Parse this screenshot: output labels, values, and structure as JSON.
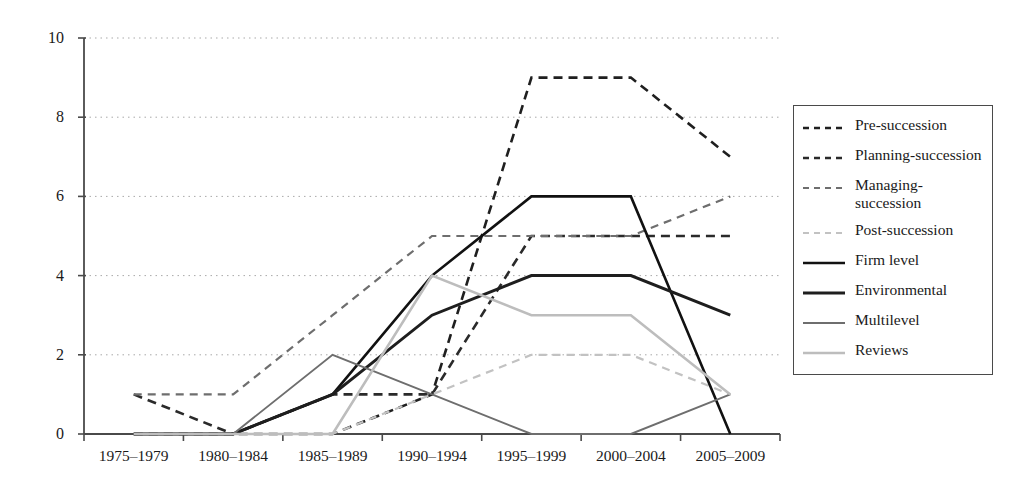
{
  "chart_data": {
    "type": "line",
    "title": "",
    "subtitle": "",
    "xlabel": "",
    "ylabel": "",
    "categories": [
      "1975–1979",
      "1980–1984",
      "1985–1989",
      "1990–1994",
      "1995–1999",
      "2000–2004",
      "2005–2009"
    ],
    "ylim": [
      0,
      10
    ],
    "yticks": [
      0,
      2,
      4,
      6,
      8,
      10
    ],
    "grid": "horizontal-dotted",
    "legend_position": "right",
    "series": [
      {
        "name": "Pre-succession",
        "style": "dashed",
        "color": "#1f1f1f",
        "width": 2.6,
        "dash": "9,6",
        "values": [
          0,
          0,
          0,
          1,
          9,
          9,
          7
        ]
      },
      {
        "name": "Planning-succession",
        "style": "dashed",
        "color": "#2a2a2a",
        "width": 2.6,
        "dash": "9,6",
        "values": [
          1,
          0,
          1,
          1,
          5,
          5,
          5
        ]
      },
      {
        "name": "Managing-succession",
        "style": "dashed",
        "color": "#6e6e6e",
        "width": 2.2,
        "dash": "8,6",
        "values": [
          1,
          1,
          3,
          5,
          5,
          5,
          6
        ]
      },
      {
        "name": "Post-succession",
        "style": "dashed",
        "color": "#c2c2c2",
        "width": 2.2,
        "dash": "8,6",
        "values": [
          0,
          0,
          0,
          1,
          2,
          2,
          1
        ]
      },
      {
        "name": "Firm level",
        "style": "solid",
        "color": "#111111",
        "width": 2.6,
        "dash": "",
        "values": [
          0,
          0,
          1,
          4,
          6,
          6,
          0
        ]
      },
      {
        "name": "Environmental",
        "style": "solid",
        "color": "#1e1e1e",
        "width": 3.0,
        "dash": "",
        "values": [
          0,
          0,
          1,
          3,
          4,
          4,
          3
        ]
      },
      {
        "name": "Multilevel",
        "style": "solid",
        "color": "#6e6e6e",
        "width": 1.9,
        "dash": "",
        "values": [
          0,
          0,
          2,
          1,
          0,
          0,
          1
        ]
      },
      {
        "name": "Reviews",
        "style": "solid",
        "color": "#bdbdbd",
        "width": 2.6,
        "dash": "",
        "values": [
          0,
          0,
          0,
          4,
          3,
          3,
          1
        ]
      }
    ]
  },
  "legend": {
    "items": [
      {
        "label": "Pre-succession"
      },
      {
        "label": "Planning-succession"
      },
      {
        "label": "Managing-succession"
      },
      {
        "label": "Post-succession"
      },
      {
        "label": "Firm level"
      },
      {
        "label": "Environmental"
      },
      {
        "label": "Multilevel"
      },
      {
        "label": "Reviews"
      }
    ]
  },
  "axes": {
    "y_tick_labels": [
      "0",
      "2",
      "4",
      "6",
      "8",
      "10"
    ],
    "x_tick_labels": [
      "1975–1979",
      "1980–1984",
      "1985–1989",
      "1990–1994",
      "1995–1999",
      "2000–2004",
      "2005–2009"
    ]
  },
  "colors": {
    "axis": "#4a4a4a",
    "grid": "#a9a9a9",
    "background": "#ffffff"
  }
}
